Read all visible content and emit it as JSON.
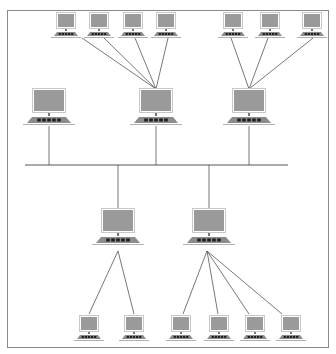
{
  "diagram": {
    "type": "network-topology",
    "colors": {
      "frame": "#8a8a8a",
      "line": "#555555",
      "monitor_fill": "#9a9a9a",
      "monitor_border": "#c8c8c8",
      "keyboard": "#8c8c8c",
      "keys": "#1e1e1e",
      "base_line": "#b0b0b0"
    },
    "bus": {
      "y": 165,
      "x1": 25,
      "x2": 288
    },
    "nodes": [
      {
        "id": "t1",
        "size": "small",
        "x": 66,
        "y": 14
      },
      {
        "id": "t2",
        "size": "small",
        "x": 99,
        "y": 14
      },
      {
        "id": "t3",
        "size": "small",
        "x": 133,
        "y": 14
      },
      {
        "id": "t4",
        "size": "small",
        "x": 166,
        "y": 14
      },
      {
        "id": "t5",
        "size": "small",
        "x": 233,
        "y": 14
      },
      {
        "id": "t6",
        "size": "small",
        "x": 270,
        "y": 14
      },
      {
        "id": "t7",
        "size": "small",
        "x": 312,
        "y": 14
      },
      {
        "id": "m1",
        "size": "large",
        "x": 49,
        "y": 90
      },
      {
        "id": "m2",
        "size": "large",
        "x": 156,
        "y": 90
      },
      {
        "id": "m3",
        "size": "large",
        "x": 249,
        "y": 90
      },
      {
        "id": "l1",
        "size": "large",
        "x": 118,
        "y": 210
      },
      {
        "id": "l2",
        "size": "large",
        "x": 209,
        "y": 210
      },
      {
        "id": "b1",
        "size": "small",
        "x": 89,
        "y": 317
      },
      {
        "id": "b2",
        "size": "small",
        "x": 134,
        "y": 317
      },
      {
        "id": "b3",
        "size": "small",
        "x": 181,
        "y": 317
      },
      {
        "id": "b4",
        "size": "small",
        "x": 219,
        "y": 317
      },
      {
        "id": "b5",
        "size": "small",
        "x": 255,
        "y": 317
      },
      {
        "id": "b6",
        "size": "small",
        "x": 291,
        "y": 317
      }
    ],
    "links": [
      {
        "from": [
          82,
          38
        ],
        "to": [
          156,
          89
        ]
      },
      {
        "from": [
          104,
          38
        ],
        "to": [
          156,
          89
        ]
      },
      {
        "from": [
          135,
          38
        ],
        "to": [
          156,
          89
        ]
      },
      {
        "from": [
          168,
          38
        ],
        "to": [
          156,
          89
        ]
      },
      {
        "from": [
          231,
          38
        ],
        "to": [
          249,
          89
        ]
      },
      {
        "from": [
          268,
          38
        ],
        "to": [
          249,
          89
        ]
      },
      {
        "from": [
          313,
          38
        ],
        "to": [
          249,
          89
        ]
      },
      {
        "from": [
          49,
          126
        ],
        "to": [
          49,
          165
        ]
      },
      {
        "from": [
          156,
          126
        ],
        "to": [
          156,
          165
        ]
      },
      {
        "from": [
          249,
          126
        ],
        "to": [
          249,
          165
        ]
      },
      {
        "from": [
          118,
          165
        ],
        "to": [
          118,
          208
        ]
      },
      {
        "from": [
          209,
          165
        ],
        "to": [
          209,
          208
        ]
      },
      {
        "from": [
          118,
          251
        ],
        "to": [
          89,
          314
        ]
      },
      {
        "from": [
          118,
          251
        ],
        "to": [
          134,
          314
        ]
      },
      {
        "from": [
          207,
          251
        ],
        "to": [
          183,
          314
        ]
      },
      {
        "from": [
          207,
          251
        ],
        "to": [
          218,
          314
        ]
      },
      {
        "from": [
          207,
          251
        ],
        "to": [
          249,
          314
        ]
      },
      {
        "from": [
          207,
          251
        ],
        "to": [
          282,
          314
        ]
      }
    ]
  }
}
